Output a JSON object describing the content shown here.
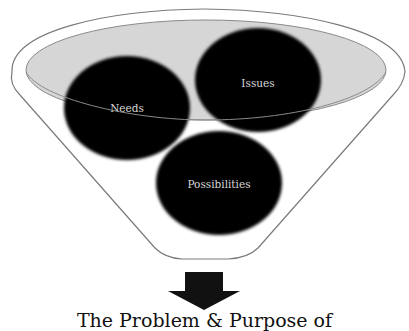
{
  "diagram": {
    "type": "funnel",
    "circles": [
      {
        "label": "Needs"
      },
      {
        "label": "Issues"
      },
      {
        "label": "Possibilities"
      }
    ],
    "output_title": "The Problem & Purpose of",
    "colors": {
      "circle_fill": "#050505",
      "circle_text": "#d8d8d8",
      "rim_fill": "#d6d6d6",
      "outline": "#7a7a7a",
      "arrow": "#111111"
    }
  }
}
